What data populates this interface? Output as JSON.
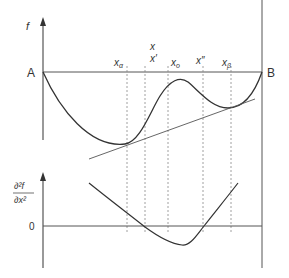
{
  "upper_plot": {
    "y_axis_label": "f",
    "left_point": "A",
    "right_point": "B",
    "x_markers": [
      {
        "label": "x",
        "sub": "α",
        "x": 127
      },
      {
        "label": "x'",
        "sub": "",
        "x": 145,
        "extra": "x"
      },
      {
        "label": "x",
        "sub": "o",
        "x": 168
      },
      {
        "label": "x''",
        "sub": "",
        "x": 203
      },
      {
        "label": "x",
        "sub": "β",
        "x": 231
      }
    ]
  },
  "lower_plot": {
    "y_axis_label_num": "∂²f",
    "y_axis_label_den": "∂x²",
    "zero_label": "0"
  },
  "colors": {
    "curve": "#333333",
    "axis": "#555555",
    "dashed": "#888888"
  }
}
